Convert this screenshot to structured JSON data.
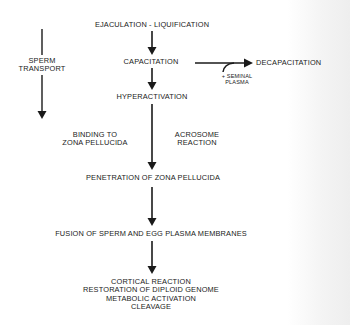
{
  "diagram": {
    "main_sequence": [
      {
        "id": "ejaculation",
        "label": "EJACULATION - LIQUIFICATION"
      },
      {
        "id": "capacitation",
        "label": "CAPACITATION"
      },
      {
        "id": "hyperactivation",
        "label": "HYPERACTIVATION"
      },
      {
        "id": "penetration",
        "label": "PENETRATION OF ZONA PELLUCIDA"
      },
      {
        "id": "fusion",
        "label": "FUSION OF SPERM AND EGG PLASMA MEMBRANES"
      }
    ],
    "outcomes": {
      "lines": [
        "CORTICAL REACTION",
        "RESTORATION OF DIPLOID GENOME",
        "METABOLIC ACTIVATION",
        "CLEAVAGE"
      ]
    },
    "side_branch": {
      "target": "DECAPACITATION",
      "condition": [
        "+ SEMINAL",
        "PLASMA"
      ]
    },
    "sperm_transport": {
      "lines": [
        "SPERM",
        "TRANSPORT"
      ]
    },
    "flank_labels": {
      "binding": [
        "BINDING TO",
        "ZONA PELLUCIDA"
      ],
      "acrosome": [
        "ACROSOME",
        "REACTION"
      ]
    },
    "colors": {
      "ink": "#1a1a1a",
      "background": "#ffffff"
    }
  }
}
